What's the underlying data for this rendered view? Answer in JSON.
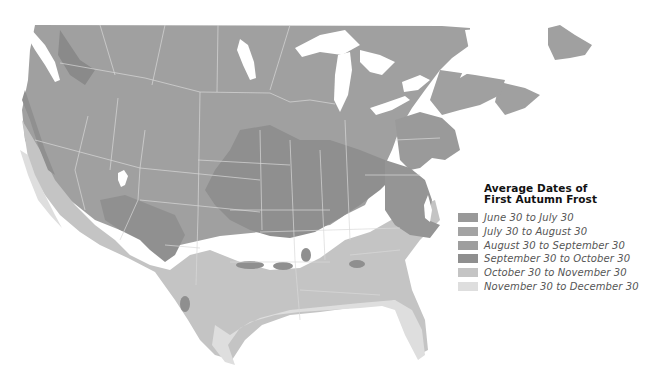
{
  "map": {
    "subject": "North America (USA and southern Canada) first autumn frost zones",
    "background_color": "#ffffff",
    "water_color": "#ffffff",
    "border_color": "#d9d9d9"
  },
  "legend": {
    "title_line1": "Average Dates of",
    "title_line2": "First Autumn Frost",
    "items": [
      {
        "label": "June 30 to July 30",
        "color": "#999999"
      },
      {
        "label": "July 30 to August 30",
        "color": "#a3a3a3"
      },
      {
        "label": "August 30 to September 30",
        "color": "#9e9e9e"
      },
      {
        "label": "September 30 to October 30",
        "color": "#8f8f8f"
      },
      {
        "label": "October 30 to November 30",
        "color": "#c4c4c4"
      },
      {
        "label": "November 30 to December 30",
        "color": "#dedede"
      }
    ]
  }
}
